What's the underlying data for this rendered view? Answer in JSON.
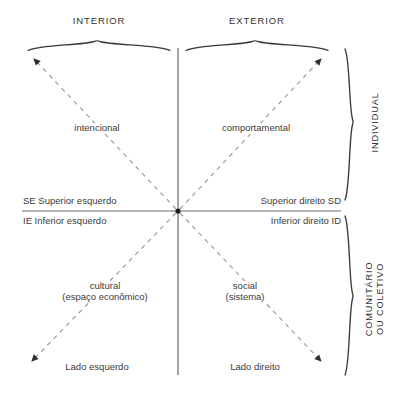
{
  "diagram": {
    "title_absent": true,
    "columns": [
      {
        "id": "interior",
        "label": "INTERIOR"
      },
      {
        "id": "exterior",
        "label": "EXTERIOR"
      }
    ],
    "rows": [
      {
        "id": "individual",
        "label": "INDIVIDUAL"
      },
      {
        "id": "comunitario",
        "label_line1": "COMUNITÁRIO",
        "label_line2": "OU COLETIVO"
      }
    ],
    "quadrants": {
      "upper_left": {
        "term": "intencional",
        "axis_label": "SE Superior esquerdo",
        "corner_label": ""
      },
      "upper_right": {
        "term": "comportamental",
        "axis_label": "Superior direito SD",
        "corner_label": ""
      },
      "lower_left": {
        "term_line1": "cultural",
        "term_line2": "(espaço econômico)",
        "axis_label": "IE Inferior esquerdo",
        "corner_label": "Lado esquerdo"
      },
      "lower_right": {
        "term_line1": "social",
        "term_line2": "(sistema)",
        "axis_label": "Inferior direito ID",
        "corner_label": "Lado direito"
      }
    },
    "colors": {
      "line": "#555555",
      "dashed": "#8c8c8c",
      "text": "#3b3b3b",
      "background": "#ffffff"
    }
  }
}
